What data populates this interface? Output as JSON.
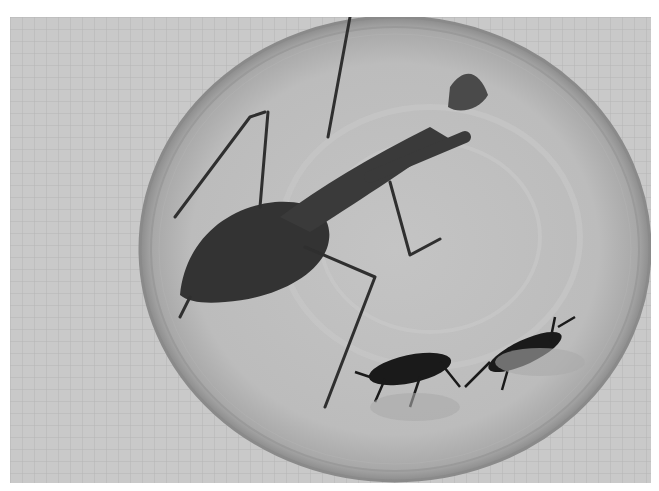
{
  "image": {
    "description": "Grayscale photo of a praying mantis and two smaller insects inside a clear petri dish on graph paper",
    "subjects": [
      "praying-mantis",
      "insect-1",
      "insect-2"
    ],
    "background": "graph-paper",
    "container": "petri-dish",
    "colors": {
      "paper": "#c9c9c9",
      "grid": "#b4b4b4",
      "dish_inner": "#bdbdbd",
      "dish_rim": "#8a8a8a",
      "insect_dark": "#2f2f2f",
      "insect_black": "#1a1a1a"
    }
  }
}
